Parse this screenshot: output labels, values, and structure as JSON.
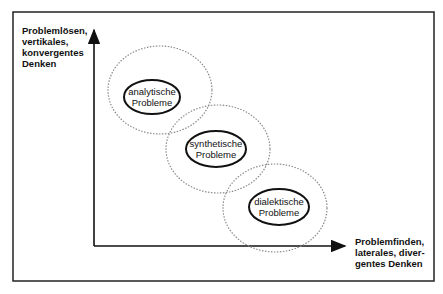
{
  "diagram": {
    "y_axis_label_lines": [
      "Problemlösen,",
      "vertikales,",
      "konvergentes",
      "Denken"
    ],
    "x_axis_label_lines": [
      "Problemfinden,",
      "laterales, diver-",
      "gentes Denken"
    ],
    "nodes": [
      {
        "id": "analytic",
        "lines": [
          "analytische",
          "Probleme"
        ]
      },
      {
        "id": "synthetic",
        "lines": [
          "synthetische",
          "Probleme"
        ]
      },
      {
        "id": "dialectic",
        "lines": [
          "dialektische",
          "Probleme"
        ]
      }
    ],
    "colors": {
      "line": "#111111",
      "dotted": "#8a8a8a",
      "background": "#ffffff"
    }
  }
}
